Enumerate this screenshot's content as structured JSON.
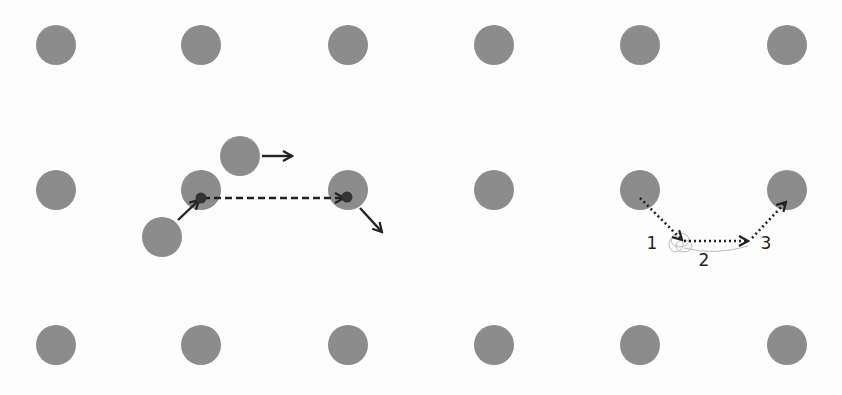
{
  "colors": {
    "background": "#fdfdfd",
    "dot": "#8c8c8c",
    "arrow": "#222222",
    "ghost": "#bbbbbb"
  },
  "grid": {
    "columns_x": [
      56,
      201,
      348,
      494,
      640,
      787
    ],
    "rows_y": [
      45,
      190,
      345
    ],
    "dot_radius": 20
  },
  "left_diagram": {
    "extra_dots": [
      {
        "x": 240,
        "y": 156
      },
      {
        "x": 162,
        "y": 237
      }
    ],
    "small_points": [
      {
        "x": 201,
        "y": 198
      },
      {
        "x": 347,
        "y": 197
      }
    ],
    "arrows": [
      {
        "type": "solid",
        "from": [
          262,
          156
        ],
        "to": [
          292,
          156
        ]
      },
      {
        "type": "solid",
        "from": [
          178,
          220
        ],
        "to": [
          199,
          200
        ]
      },
      {
        "type": "dashed",
        "from": [
          203,
          198
        ],
        "to": [
          344,
          198
        ]
      },
      {
        "type": "solid",
        "from": [
          360,
          208
        ],
        "to": [
          382,
          232
        ]
      }
    ]
  },
  "right_diagram": {
    "arrows": [
      {
        "type": "dotted",
        "from": [
          640,
          198
        ],
        "to": [
          682,
          240
        ]
      },
      {
        "type": "dotted",
        "from": [
          684,
          241
        ],
        "to": [
          748,
          241
        ]
      },
      {
        "type": "dotted",
        "from": [
          752,
          238
        ],
        "to": [
          786,
          202
        ]
      }
    ],
    "labels": [
      {
        "text": "1",
        "x": 652,
        "y": 249
      },
      {
        "text": "2",
        "x": 704,
        "y": 266
      },
      {
        "text": "3",
        "x": 766,
        "y": 249
      }
    ]
  }
}
